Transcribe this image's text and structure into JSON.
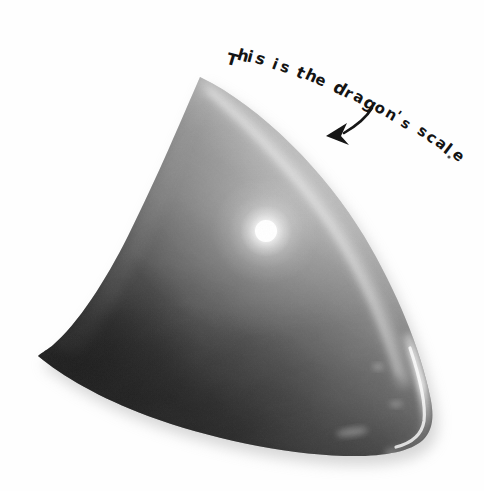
{
  "canvas": {
    "width": 484,
    "height": 491,
    "background_color": "#fefefe"
  },
  "annotation": {
    "text": "This is the dragon's scale",
    "ink_color": "#141414",
    "style": "handwritten-marker",
    "trailing_mark": ".",
    "words": [
      "This",
      "is",
      "the",
      "dragon's",
      "scale"
    ],
    "arrow": {
      "name": "pointer-arrow",
      "direction": "down-left",
      "color": "#141414",
      "tip_x": 328,
      "tip_y": 135
    },
    "glyphs": [
      {
        "ch": "T",
        "x": 226,
        "y": 52,
        "rot": 14,
        "size": 16
      },
      {
        "ch": "h",
        "x": 237,
        "y": 48,
        "rot": 16,
        "size": 16
      },
      {
        "ch": "i",
        "x": 247,
        "y": 49,
        "rot": 18,
        "size": 16
      },
      {
        "ch": "s",
        "x": 255,
        "y": 51,
        "rot": 19,
        "size": 16
      },
      {
        "ch": "i",
        "x": 272,
        "y": 57,
        "rot": 21,
        "size": 15
      },
      {
        "ch": "s",
        "x": 280,
        "y": 60,
        "rot": 22,
        "size": 15
      },
      {
        "ch": "t",
        "x": 296,
        "y": 65,
        "rot": 24,
        "size": 16
      },
      {
        "ch": "h",
        "x": 305,
        "y": 68,
        "rot": 25,
        "size": 16
      },
      {
        "ch": "e",
        "x": 315,
        "y": 73,
        "rot": 26,
        "size": 15
      },
      {
        "ch": "d",
        "x": 333,
        "y": 80,
        "rot": 28,
        "size": 17
      },
      {
        "ch": "r",
        "x": 344,
        "y": 86,
        "rot": 29,
        "size": 15
      },
      {
        "ch": "a",
        "x": 353,
        "y": 90,
        "rot": 30,
        "size": 15
      },
      {
        "ch": "g",
        "x": 363,
        "y": 95,
        "rot": 31,
        "size": 17
      },
      {
        "ch": "o",
        "x": 374,
        "y": 101,
        "rot": 32,
        "size": 15
      },
      {
        "ch": "n",
        "x": 385,
        "y": 107,
        "rot": 33,
        "size": 15
      },
      {
        "ch": "'",
        "x": 395,
        "y": 108,
        "rot": 34,
        "size": 14
      },
      {
        "ch": "s",
        "x": 401,
        "y": 116,
        "rot": 35,
        "size": 14
      },
      {
        "ch": "s",
        "x": 417,
        "y": 124,
        "rot": 37,
        "size": 15
      },
      {
        "ch": "c",
        "x": 426,
        "y": 130,
        "rot": 38,
        "size": 15
      },
      {
        "ch": "a",
        "x": 435,
        "y": 136,
        "rot": 39,
        "size": 15
      },
      {
        "ch": "l",
        "x": 444,
        "y": 141,
        "rot": 40,
        "size": 16
      },
      {
        "ch": "e",
        "x": 452,
        "y": 148,
        "rot": 41,
        "size": 15
      }
    ]
  },
  "subject": {
    "name": "dragon-scale",
    "description": "Dark glossy curved triangular scale photographed on white",
    "shape": "curved triangle with concave left edge, convex bottom edge, rounded right corner",
    "apex_x": 200,
    "apex_y": 77,
    "left_tip_x": 38,
    "left_tip_y": 355,
    "right_corner_x": 430,
    "right_corner_y": 442,
    "outline_path": "M 200 77 C 170 150, 120 250, 60 330 C 52 342, 44 350, 38 356 C 90 392, 150 420, 215 438 C 280 456, 345 462, 390 455 C 418 450, 432 436, 430 418 C 425 370, 400 300, 355 225 C 318 163, 255 105, 200 77 Z",
    "colors": {
      "darkest": "#262626",
      "dark": "#343434",
      "body_dark": "#3c3c3c",
      "mid": "#6e6e6e",
      "light_mid": "#8a8a8a",
      "light": "#b4b4b4",
      "rim_highlight": "#e8e8e8",
      "specular": "#ffffff"
    },
    "specular_highlight": {
      "name": "specular-hotspot",
      "center_x": 266,
      "center_y": 231,
      "core_radius": 11,
      "glow_radius": 52,
      "color": "#ffffff"
    },
    "rim_light_upper_right": {
      "from_x": 214,
      "from_y": 95,
      "to_x": 400,
      "to_y": 330,
      "color": "#d8d8d8"
    },
    "rim_light_bottom_right": {
      "from_x": 405,
      "from_y": 350,
      "to_x": 395,
      "to_y": 450,
      "color": "#f2f2f2"
    },
    "drop_shadow": {
      "name": "cast-shadow",
      "color": "#c9c9c9",
      "offset_x": 4,
      "offset_y": 7,
      "blur": 9
    }
  }
}
